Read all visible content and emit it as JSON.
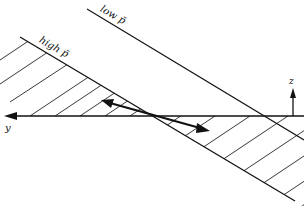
{
  "diagram": {
    "labels": {
      "high_line": "high p̄",
      "low_line": "low p̄",
      "y_axis": "y",
      "z_axis": "z"
    },
    "colors": {
      "stroke": "#111111",
      "background": "#ffffff"
    },
    "elements": [
      "y-axis (horizontal, arrow pointing left)",
      "z-axis (vertical arrow pointing up)",
      "high p̄ line with hatched region",
      "low p̄ line",
      "double-headed arrow along isopycnal slope"
    ]
  }
}
